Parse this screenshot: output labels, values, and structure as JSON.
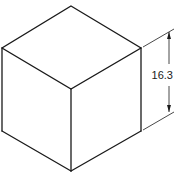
{
  "figure": {
    "type": "isometric-cube",
    "dimension": {
      "label": "16.3",
      "orientation": "vertical"
    },
    "colors": {
      "line": "#1a1a1a",
      "background": "#ffffff"
    }
  }
}
